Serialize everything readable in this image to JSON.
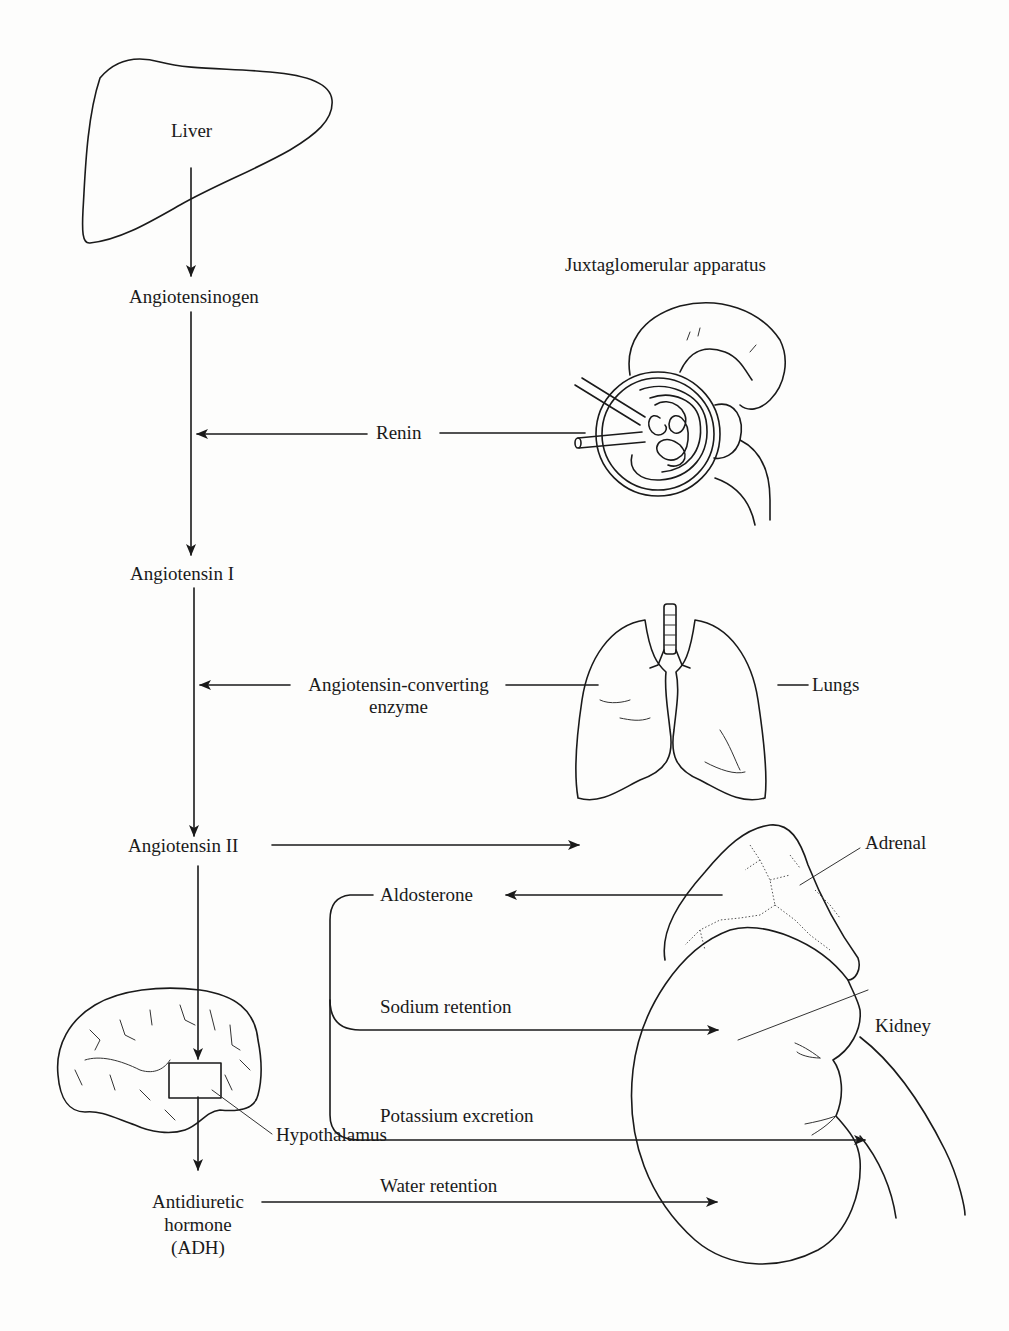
{
  "diagram": {
    "type": "renin-angiotensin-aldosterone system flow",
    "colors": {
      "ink": "#1a1a1a",
      "paper": "#fdfdfc"
    },
    "organs": {
      "liver": {
        "label": "Liver"
      },
      "juxtaglomerular": {
        "label": "Juxtaglomerular apparatus"
      },
      "lungs": {
        "label": "Lungs"
      },
      "adrenal": {
        "label": "Adrenal"
      },
      "kidney": {
        "label": "Kidney"
      },
      "hypothalamus": {
        "label": "Hypothalamus"
      }
    },
    "nodes": {
      "angiotensinogen": "Angiotensinogen",
      "angiotensin_1": "Angiotensin I",
      "angiotensin_2": "Angiotensin II",
      "adh_line1": "Antidiuretic",
      "adh_line2": "hormone",
      "adh_line3": "(ADH)"
    },
    "enzymes": {
      "renin": "Renin",
      "ace_line1": "Angiotensin-converting",
      "ace_line2": "enzyme"
    },
    "effects": {
      "aldosterone": "Aldosterone",
      "sodium": "Sodium retention",
      "potassium": "Potassium excretion",
      "water": "Water retention"
    },
    "edges": [
      {
        "from": "Liver",
        "to": "Angiotensinogen"
      },
      {
        "from": "Angiotensinogen",
        "to": "Angiotensin I",
        "via": "Renin"
      },
      {
        "from": "Juxtaglomerular apparatus",
        "to": "Renin"
      },
      {
        "from": "Angiotensin I",
        "to": "Angiotensin II",
        "via": "Angiotensin-converting enzyme"
      },
      {
        "from": "Lungs",
        "to": "Angiotensin-converting enzyme"
      },
      {
        "from": "Angiotensin II",
        "to": "Adrenal"
      },
      {
        "from": "Adrenal",
        "to": "Aldosterone"
      },
      {
        "from": "Aldosterone",
        "to": "Kidney",
        "label": "Sodium retention"
      },
      {
        "from": "Aldosterone",
        "to": "Kidney",
        "label": "Potassium excretion"
      },
      {
        "from": "Angiotensin II",
        "to": "Hypothalamus"
      },
      {
        "from": "Hypothalamus",
        "to": "Antidiuretic hormone (ADH)"
      },
      {
        "from": "Antidiuretic hormone (ADH)",
        "to": "Kidney",
        "label": "Water retention"
      }
    ]
  }
}
